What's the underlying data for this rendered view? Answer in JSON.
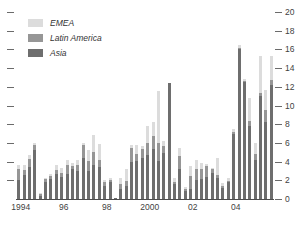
{
  "chart_data": {
    "type": "bar",
    "title": "",
    "subtitle": "",
    "xlabel": "",
    "ylabel": "",
    "stacked": true,
    "grid": false,
    "legend_position": "top-left",
    "ylim": [
      0,
      20
    ],
    "y_ticks": [
      0,
      2,
      4,
      6,
      8,
      10,
      12,
      14,
      16,
      18,
      20
    ],
    "y_tick_labels": [
      "0",
      "2",
      "4",
      "6",
      "8",
      "10",
      "12",
      "14",
      "16",
      "18",
      "20"
    ],
    "y_axis_side": "right",
    "left_axis_ticks_unlabeled": 10,
    "x_tick_labels": [
      "1994",
      "96",
      "98",
      "2000",
      "02",
      "04"
    ],
    "x_tick_positions": [
      0,
      8,
      16,
      24,
      32,
      40
    ],
    "x_note": "quarterly observations, 1994 Q1 through 2005 Q4",
    "categories": [
      "1994 Q1",
      "1994 Q2",
      "1994 Q3",
      "1994 Q4",
      "1995 Q1",
      "1995 Q2",
      "1995 Q3",
      "1995 Q4",
      "1996 Q1",
      "1996 Q2",
      "1996 Q3",
      "1996 Q4",
      "1997 Q1",
      "1997 Q2",
      "1997 Q3",
      "1997 Q4",
      "1998 Q1",
      "1998 Q2",
      "1998 Q3",
      "1998 Q4",
      "1999 Q1",
      "1999 Q2",
      "1999 Q3",
      "1999 Q4",
      "2000 Q1",
      "2000 Q2",
      "2000 Q3",
      "2000 Q4",
      "2001 Q1",
      "2001 Q2",
      "2001 Q3",
      "2001 Q4",
      "2002 Q1",
      "2002 Q2",
      "2002 Q3",
      "2002 Q4",
      "2003 Q1",
      "2003 Q2",
      "2003 Q3",
      "2003 Q4",
      "2004 Q1",
      "2004 Q2",
      "2004 Q3",
      "2004 Q4",
      "2005 Q1",
      "2005 Q2",
      "2005 Q3",
      "2005 Q4"
    ],
    "series": [
      {
        "name": "Asia",
        "color": "#6e6e6e",
        "values": [
          2.0,
          2.6,
          3.4,
          5.2,
          0.3,
          1.8,
          2.1,
          2.7,
          2.4,
          2.7,
          3.2,
          3.0,
          4.4,
          3.0,
          3.6,
          3.4,
          1.4,
          1.8,
          0.1,
          1.1,
          1.4,
          4.0,
          4.1,
          4.4,
          4.7,
          5.3,
          4.1,
          4.9,
          12.4,
          1.6,
          3.2,
          0.9,
          1.1,
          2.0,
          2.1,
          2.4,
          2.8,
          2.2,
          1.2,
          1.8,
          7.0,
          16.0,
          12.5,
          7.8,
          4.2,
          11.0,
          8.2,
          12.2
        ]
      },
      {
        "name": "Latin America",
        "color": "#969696",
        "values": [
          1.2,
          0.5,
          0.9,
          0.6,
          0.2,
          0.3,
          0.4,
          0.4,
          0.4,
          0.9,
          0.3,
          0.6,
          1.4,
          1.1,
          1.4,
          0.8,
          0.4,
          0.2,
          0.0,
          0.5,
          0.5,
          1.5,
          0.7,
          1.0,
          1.3,
          1.4,
          1.9,
          0.8,
          0.0,
          0.2,
          1.4,
          0.2,
          1.4,
          1.2,
          1.1,
          1.1,
          0.4,
          0.4,
          0.2,
          0.1,
          0.2,
          0.2,
          0.1,
          0.5,
          0.6,
          0.3,
          1.3,
          0.5
        ]
      },
      {
        "name": "EMEA",
        "color": "#dcdcdc",
        "values": [
          0.4,
          0.5,
          0.4,
          0.2,
          0.1,
          0.2,
          0.2,
          0.5,
          0.5,
          0.6,
          0.4,
          0.6,
          0.2,
          1.1,
          1.9,
          1.7,
          0.2,
          0.2,
          0.0,
          0.7,
          1.3,
          0.3,
          1.0,
          0.3,
          1.8,
          1.5,
          5.5,
          0.5,
          0.0,
          0.4,
          0.9,
          0.2,
          1.0,
          1.0,
          0.6,
          0.2,
          0.1,
          1.8,
          0.3,
          0.3,
          0.3,
          0.3,
          0.2,
          2.5,
          1.2,
          4.0,
          2.2,
          2.6
        ]
      }
    ],
    "legend": [
      {
        "label": "EMEA",
        "color": "#dcdcdc"
      },
      {
        "label": "Latin America",
        "color": "#969696"
      },
      {
        "label": "Asia",
        "color": "#6e6e6e"
      }
    ]
  }
}
